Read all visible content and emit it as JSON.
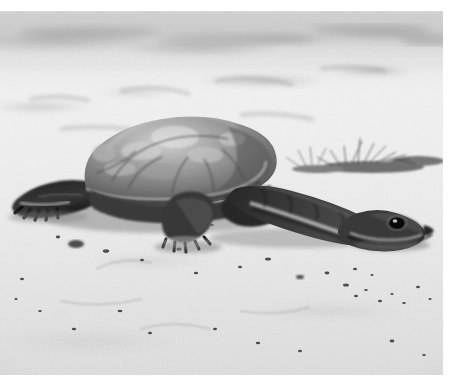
{
  "image": {
    "kind": "photograph",
    "medium": "black-and-white film photograph",
    "subject": "long-necked (snake-necked) freshwater turtle",
    "scene": "turtle walking across pale sand",
    "orientation": "landscape",
    "width_px": 456,
    "height_px": 391,
    "alt_text": "Black and white photograph of a long-necked turtle crawling across pale sand, its neck extended fully forward to the right and its domed carapace mottled with light patches."
  },
  "plate": {
    "left_px": 0,
    "top_px": 11,
    "width_px": 443,
    "height_px": 364,
    "border_color": "#ffffff",
    "has_white_margin_top": true,
    "has_white_margin_right": true,
    "has_white_margin_bottom": true
  },
  "palette": {
    "paper_white": "#ffffff",
    "sand_light": "#ededed",
    "sand_mid": "#e0e0e0",
    "sand_shadow": "#c9c9c9",
    "shell_light": "#b9b9b9",
    "shell_mid": "#8a8a8a",
    "shell_dark": "#5a5a5a",
    "skin_dark": "#3a3a3a",
    "skin_darkest": "#1c1c1c",
    "highlight": "#f4f4f4",
    "eye_black": "#0d0d0d"
  },
  "subject_parts": [
    {
      "name": "carapace",
      "label": "domed mottled shell",
      "tone": "mid-gray with light patches"
    },
    {
      "name": "neck",
      "label": "long extended neck",
      "tone": "dark with pale underside stripe"
    },
    {
      "name": "head",
      "label": "tapered head with visible eye",
      "tone": "dark gray"
    },
    {
      "name": "eye",
      "label": "dark round eye with catchlight",
      "tone": "near black"
    },
    {
      "name": "front-left-leg",
      "label": "front left leg with claws",
      "tone": "very dark"
    },
    {
      "name": "front-right-leg",
      "label": "front right leg with claws",
      "tone": "very dark"
    },
    {
      "name": "shadow",
      "label": "cast shadow on sand",
      "tone": "soft mid-gray"
    }
  ],
  "background_elements": [
    {
      "name": "sand-ground",
      "label": "pale sand substrate"
    },
    {
      "name": "grass-tuft",
      "label": "dark grass and twig clump, upper right"
    },
    {
      "name": "blurred-horizon",
      "label": "out-of-focus darker band across the top"
    },
    {
      "name": "debris-speckles",
      "label": "scattered dark pebbles and debris on sand"
    }
  ]
}
